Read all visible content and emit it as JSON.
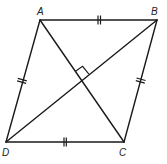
{
  "figure": {
    "shape": "rhombus",
    "vertices": [
      {
        "name": "A",
        "label": "A"
      },
      {
        "name": "B",
        "label": "B"
      },
      {
        "name": "C",
        "label": "C"
      },
      {
        "name": "D",
        "label": "D"
      }
    ],
    "sides": [
      {
        "name": "AB",
        "from": "A",
        "to": "B",
        "tick_marks": 2
      },
      {
        "name": "BC",
        "from": "B",
        "to": "C",
        "tick_marks": 2
      },
      {
        "name": "CD",
        "from": "C",
        "to": "D",
        "tick_marks": 2
      },
      {
        "name": "DA",
        "from": "D",
        "to": "A",
        "tick_marks": 2
      }
    ],
    "diagonals": [
      {
        "name": "AC",
        "from": "A",
        "to": "C"
      },
      {
        "name": "BD",
        "from": "B",
        "to": "D"
      }
    ],
    "right_angle_marker": {
      "at": "diagonal-intersection",
      "between": [
        "AC",
        "BD"
      ]
    },
    "colors": {
      "stroke": "#1a1a1a",
      "label": "#222222",
      "background": "#ffffff"
    }
  }
}
